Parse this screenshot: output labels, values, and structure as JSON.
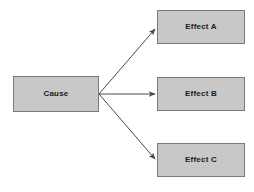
{
  "diagram": {
    "type": "cause-effect-flow",
    "background_color": "#ffffff",
    "node_fill_color": "#c8c8c8",
    "node_border_color": "#7a7a7a",
    "arrow_color": "#4a4a4a",
    "label_color": "#1a1a1a",
    "nodes": [
      {
        "id": "cause",
        "label": "Cause",
        "x": 13,
        "y": 76,
        "width": 86,
        "height": 36
      },
      {
        "id": "effect_a",
        "label": "Effect A",
        "x": 157,
        "y": 10,
        "width": 88,
        "height": 34
      },
      {
        "id": "effect_b",
        "label": "Effect B",
        "x": 157,
        "y": 77,
        "width": 88,
        "height": 34
      },
      {
        "id": "effect_c",
        "label": "Effect C",
        "x": 157,
        "y": 143,
        "width": 88,
        "height": 34
      }
    ],
    "edges": [
      {
        "id": "cause-to-effect-a",
        "from": "cause",
        "to": "effect_a",
        "x1": 99,
        "y1": 94,
        "x2": 156,
        "y2": 28,
        "arrowhead": "end"
      },
      {
        "id": "cause-to-effect-b",
        "from": "cause",
        "to": "effect_b",
        "x1": 99,
        "y1": 94,
        "x2": 156,
        "y2": 94,
        "arrowhead": "end"
      },
      {
        "id": "cause-to-effect-c",
        "from": "cause",
        "to": "effect_c",
        "x1": 99,
        "y1": 94,
        "x2": 156,
        "y2": 160,
        "arrowhead": "end"
      }
    ]
  }
}
